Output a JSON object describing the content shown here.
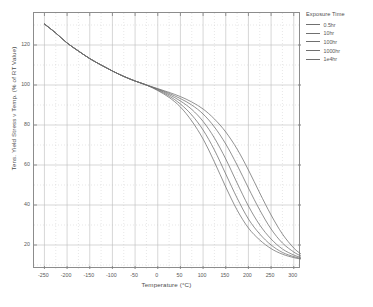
{
  "chart_data": {
    "type": "line",
    "title": "",
    "xlabel": "Temperature (°C)",
    "ylabel": "Tens. Yield Stress v Temp.  (% of RT Value)",
    "xlim": [
      -273,
      316
    ],
    "ylim": [
      8,
      136
    ],
    "xticks": [
      -250,
      -200,
      -150,
      -100,
      -50,
      0,
      50,
      100,
      150,
      200,
      250,
      300
    ],
    "xtick_labels": [
      "-250",
      "-200",
      "-150",
      "-100",
      "-50",
      "0",
      "50",
      "100",
      "150",
      "200",
      "250",
      "300"
    ],
    "yticks": [
      20,
      40,
      60,
      80,
      100,
      120
    ],
    "ytick_labels": [
      "20",
      "40",
      "60",
      "80",
      "100",
      "120"
    ],
    "grid": true,
    "grid_minor": true,
    "legend_position": "right-outside",
    "legend_title": "Exposure Time",
    "line_color": "#6e6e6e",
    "axis_color": "#8c8c8c",
    "grid_color": "#c8c8c8",
    "x": [
      -250,
      -225,
      -200,
      -175,
      -150,
      -125,
      -100,
      -75,
      -50,
      -25,
      0,
      25,
      50,
      75,
      100,
      125,
      150,
      175,
      200,
      225,
      250,
      275,
      300,
      316
    ],
    "series": [
      {
        "name": "0.5hr",
        "values": [
          130.5,
          126.0,
          121.0,
          117.0,
          113.2,
          110.0,
          107.0,
          104.3,
          102.0,
          100.0,
          98.2,
          96.3,
          94.2,
          91.5,
          88.0,
          83.0,
          76.5,
          68.0,
          57.5,
          46.0,
          35.0,
          25.5,
          18.5,
          15.5
        ]
      },
      {
        "name": "10hr",
        "values": [
          130.5,
          126.0,
          121.0,
          117.0,
          113.2,
          110.0,
          107.0,
          104.3,
          102.0,
          100.0,
          98.0,
          95.8,
          93.2,
          90.0,
          85.5,
          79.0,
          70.5,
          60.0,
          48.5,
          37.5,
          28.0,
          21.0,
          16.5,
          14.5
        ]
      },
      {
        "name": "100hr",
        "values": [
          130.5,
          126.0,
          121.0,
          117.0,
          113.2,
          110.0,
          107.0,
          104.3,
          102.0,
          100.0,
          97.8,
          95.2,
          92.0,
          87.8,
          81.8,
          73.5,
          63.0,
          51.0,
          39.5,
          30.0,
          23.0,
          18.0,
          15.0,
          13.8
        ]
      },
      {
        "name": "1000hr",
        "values": [
          130.5,
          126.0,
          121.0,
          117.0,
          113.2,
          110.0,
          107.0,
          104.3,
          102.0,
          100.0,
          97.5,
          94.5,
          90.5,
          85.0,
          77.5,
          67.5,
          55.5,
          43.5,
          33.0,
          25.5,
          20.0,
          16.3,
          14.2,
          13.3
        ]
      },
      {
        "name": "1e4hr",
        "values": [
          130.5,
          126.0,
          121.0,
          117.0,
          113.2,
          110.0,
          107.0,
          104.3,
          102.0,
          100.0,
          97.2,
          93.8,
          89.0,
          82.0,
          73.0,
          61.5,
          49.0,
          37.5,
          28.5,
          22.5,
          18.2,
          15.4,
          13.7,
          13.0
        ]
      }
    ]
  },
  "legend": {
    "title": "Exposure Time",
    "items": [
      {
        "label": "0.5hr"
      },
      {
        "label": "10hr"
      },
      {
        "label": "100hr"
      },
      {
        "label": "1000hr"
      },
      {
        "label": "1e4hr"
      }
    ]
  }
}
